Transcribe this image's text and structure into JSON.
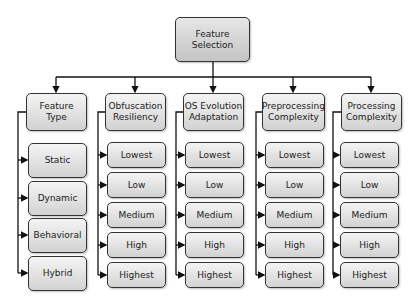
{
  "root": {
    "label": "Feature\nSelection"
  },
  "columns": [
    {
      "header": "Feature\nType",
      "children": [
        "Static",
        "Dynamic",
        "Behavioral",
        "Hybrid"
      ]
    },
    {
      "header": "Obfuscation\nResiliency",
      "children": [
        "Lowest",
        "Low",
        "Medium",
        "High",
        "Highest"
      ]
    },
    {
      "header": "OS Evolution\nAdaptation",
      "children": [
        "Lowest",
        "Low",
        "Medium",
        "High",
        "Highest"
      ]
    },
    {
      "header": "Preprocessing\nComplexity",
      "children": [
        "Lowest",
        "Low",
        "Medium",
        "High",
        "Highest"
      ]
    },
    {
      "header": "Processing\nComplexity",
      "children": [
        "Lowest",
        "Low",
        "Medium",
        "High",
        "Highest"
      ]
    }
  ]
}
